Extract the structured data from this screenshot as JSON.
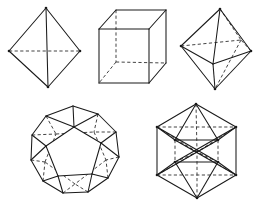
{
  "figure": {
    "background_color": "#ffffff",
    "visible_edge_color": "#1a1a1a",
    "hidden_edge_color": "#3a3a3a",
    "caption": "",
    "width": 258,
    "height": 212,
    "row_count": 2
  },
  "chart_data": {
    "type": "diagram",
    "xlabel": "",
    "ylabel": "",
    "legend": [
      "solid line = visible edge",
      "dashed line = hidden edge"
    ],
    "categories": [
      "Tetrahedron",
      "Cube",
      "Octahedron",
      "Dodecahedron",
      "Icosahedron"
    ],
    "values": [
      4,
      6,
      8,
      12,
      20
    ],
    "series": [
      {
        "name": "faces",
        "values": [
          4,
          6,
          8,
          12,
          20
        ]
      },
      {
        "name": "vertices",
        "values": [
          4,
          8,
          6,
          20,
          12
        ]
      },
      {
        "name": "edges",
        "values": [
          6,
          12,
          12,
          30,
          30
        ]
      }
    ]
  },
  "solids": [
    {
      "id": "tetrahedron",
      "name": "Tetrahedron",
      "faces": 4,
      "vertices": 4,
      "edges": 6,
      "row": 1,
      "position": {
        "x": 2,
        "y": 2,
        "w": 88,
        "h": 92
      },
      "viewbox": "0 0 88 92",
      "visible_paths": [
        "M 44 6 L 7 49",
        "M 44 6 L 78 49",
        "M 44 6 L 46 85",
        "M 7 49 L 46 85",
        "M 78 49 L 46 85"
      ],
      "hidden_paths": [
        "M 7 49 L 78 49"
      ],
      "vertex_dots": [
        {
          "x": 44,
          "y": 6
        },
        {
          "x": 7,
          "y": 49
        },
        {
          "x": 78,
          "y": 49
        },
        {
          "x": 46,
          "y": 85
        }
      ]
    },
    {
      "id": "cube",
      "name": "Cube",
      "faces": 6,
      "vertices": 8,
      "edges": 12,
      "row": 1,
      "position": {
        "x": 88,
        "y": 2,
        "w": 86,
        "h": 92
      },
      "viewbox": "0 0 86 92",
      "visible_paths": [
        "M 11 27 L 11 81",
        "M 11 81 L 61 81",
        "M 61 81 L 61 27",
        "M 61 27 L 11 27",
        "M 11 27 L 28 8",
        "M 61 27 L 78 8",
        "M 61 81 L 78 61",
        "M 28 8 L 78 8",
        "M 78 8 L 78 61"
      ],
      "hidden_paths": [
        "M 28 8 L 28 60",
        "M 28 60 L 78 61",
        "M 28 60 L 11 81"
      ],
      "vertex_dots": []
    },
    {
      "id": "octahedron",
      "name": "Octahedron",
      "faces": 8,
      "vertices": 6,
      "edges": 12,
      "row": 1,
      "position": {
        "x": 172,
        "y": 2,
        "w": 86,
        "h": 94
      },
      "viewbox": "0 0 86 94",
      "visible_paths": [
        "M 48 7 L 9 44",
        "M 48 7 L 79 49",
        "M 48 7 L 41 62",
        "M 9 44 L 41 62",
        "M 79 49 L 41 62",
        "M 9 44 L 43 87",
        "M 79 49 L 43 87",
        "M 41 62 L 43 87"
      ],
      "hidden_paths": [
        "M 9 44 L 69 38",
        "M 79 49 L 69 38",
        "M 48 7 L 69 38",
        "M 69 38 L 43 87"
      ],
      "vertex_dots": [
        {
          "x": 48,
          "y": 7
        },
        {
          "x": 9,
          "y": 44
        },
        {
          "x": 79,
          "y": 49
        },
        {
          "x": 43,
          "y": 87
        }
      ]
    },
    {
      "id": "dodecahedron",
      "name": "Dodecahedron",
      "faces": 12,
      "vertices": 20,
      "edges": 30,
      "row": 2,
      "position": {
        "x": 20,
        "y": 98,
        "w": 112,
        "h": 112
      },
      "viewbox": "0 0 112 112",
      "outer_polygon": "53 8, 78 16, 96 34, 99 59, 88 80, 68 94, 43 95, 23 83, 11 62, 12 37, 26 18",
      "front_pentagon": "54 29, 81 45, 72 76, 38 78, 26 48",
      "visible_paths": [
        "M 53 8 L 26 18",
        "M 26 18 L 12 37",
        "M 12 37 L 11 62",
        "M 11 62 L 23 83",
        "M 23 83 L 43 95",
        "M 43 95 L 68 94",
        "M 68 94 L 88 80",
        "M 88 80 L 99 59",
        "M 99 59 L 96 34",
        "M 96 34 L 78 16",
        "M 78 16 L 53 8",
        "M 54 29 L 81 45",
        "M 81 45 L 72 76",
        "M 72 76 L 38 78",
        "M 38 78 L 26 48",
        "M 26 48 L 54 29",
        "M 53 8 L 54 29",
        "M 96 34 L 81 45",
        "M 88 80 L 72 76",
        "M 43 95 L 38 78",
        "M 11 62 L 26 48",
        "M 12 37 L 26 48",
        "M 23 83 L 38 78",
        "M 68 94 L 72 76",
        "M 99 59 L 81 45",
        "M 78 16 L 54 29",
        "M 26 18 L 54 29"
      ],
      "hidden_paths": [
        "M 36 36 L 74 34",
        "M 74 34 L 86 62",
        "M 86 62 L 55 86",
        "M 55 86 L 25 64",
        "M 25 64 L 36 36",
        "M 26 18 L 36 36",
        "M 78 16 L 74 34",
        "M 99 59 L 86 62",
        "M 68 94 L 55 86",
        "M 23 83 L 25 64",
        "M 12 37 L 36 36",
        "M 96 34 L 74 34",
        "M 88 80 L 86 62",
        "M 43 95 L 55 86",
        "M 11 62 L 25 64"
      ],
      "vertex_dots": []
    },
    {
      "id": "icosahedron",
      "name": "Icosahedron",
      "faces": 20,
      "vertices": 12,
      "edges": 30,
      "row": 2,
      "position": {
        "x": 140,
        "y": 96,
        "w": 112,
        "h": 114
      },
      "viewbox": "0 0 112 114",
      "outer_polygon": "56 8, 96 31, 96 79, 57 102, 17 79, 17 31",
      "visible_paths": [
        "M 56 8 L 96 31",
        "M 96 31 L 96 79",
        "M 96 79 L 57 102",
        "M 57 102 L 17 79",
        "M 17 79 L 17 31",
        "M 17 31 L 56 8",
        "M 56 8 L 35 44",
        "M 56 8 L 78 44",
        "M 35 44 L 78 44",
        "M 17 31 L 35 44",
        "M 96 31 L 78 44",
        "M 57 102 L 35 66",
        "M 57 102 L 78 66",
        "M 35 66 L 78 66",
        "M 17 79 L 35 66",
        "M 96 79 L 78 66",
        "M 17 31 L 78 66",
        "M 96 31 L 35 66",
        "M 17 79 L 78 44",
        "M 96 79 L 35 44"
      ],
      "hidden_paths": [
        "M 17 31 L 96 31",
        "M 17 79 L 96 79",
        "M 56 8 L 57 56",
        "M 57 102 L 57 56",
        "M 35 44 L 57 56",
        "M 78 44 L 57 56",
        "M 35 66 L 57 56",
        "M 78 66 L 57 56",
        "M 17 31 L 57 56",
        "M 96 31 L 57 56",
        "M 17 79 L 57 56",
        "M 96 79 L 57 56",
        "M 35 44 L 35 66",
        "M 78 44 L 78 66"
      ],
      "vertex_dots": [
        {
          "x": 56,
          "y": 8
        },
        {
          "x": 96,
          "y": 31
        },
        {
          "x": 96,
          "y": 79
        },
        {
          "x": 57,
          "y": 102
        },
        {
          "x": 17,
          "y": 79
        },
        {
          "x": 17,
          "y": 31
        },
        {
          "x": 35,
          "y": 44
        },
        {
          "x": 78,
          "y": 44
        },
        {
          "x": 35,
          "y": 66
        },
        {
          "x": 78,
          "y": 66
        }
      ]
    }
  ]
}
